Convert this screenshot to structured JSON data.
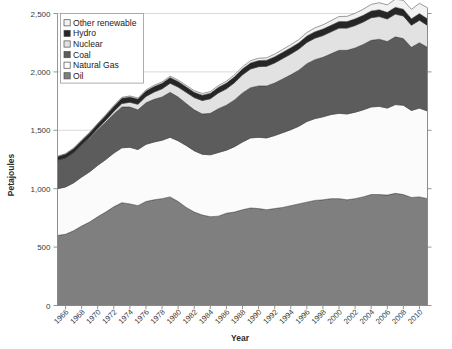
{
  "chart_data": {
    "type": "area",
    "title": "",
    "subtitle": "",
    "xlabel": "Year",
    "ylabel": "Petajoules",
    "stacked": true,
    "grid": true,
    "legend_position": "top-left",
    "xlim": [
      1965,
      2011
    ],
    "ylim": [
      0,
      2500
    ],
    "ytick_labels": [
      "0",
      "500",
      "1,000",
      "1,500",
      "2,000",
      "2,500"
    ],
    "ytick_values": [
      0,
      500,
      1000,
      1500,
      2000,
      2500
    ],
    "x": [
      1965,
      1966,
      1967,
      1968,
      1969,
      1970,
      1971,
      1972,
      1973,
      1974,
      1975,
      1976,
      1977,
      1978,
      1979,
      1980,
      1981,
      1982,
      1983,
      1984,
      1985,
      1986,
      1987,
      1988,
      1989,
      1990,
      1991,
      1992,
      1993,
      1994,
      1995,
      1996,
      1997,
      1998,
      1999,
      2000,
      2001,
      2002,
      2003,
      2004,
      2005,
      2006,
      2007,
      2008,
      2009,
      2010,
      2011
    ],
    "xtick_labels": [
      "1966",
      "1968",
      "1970",
      "1972",
      "1974",
      "1976",
      "1978",
      "1980",
      "1982",
      "1984",
      "1986",
      "1988",
      "1990",
      "1992",
      "1994",
      "1996",
      "1998",
      "2000",
      "2002",
      "2004",
      "2006",
      "2008",
      "2010"
    ],
    "xtick_values": [
      1966,
      1968,
      1970,
      1972,
      1974,
      1976,
      1978,
      1980,
      1982,
      1984,
      1986,
      1988,
      1990,
      1992,
      1994,
      1996,
      1998,
      2000,
      2002,
      2004,
      2006,
      2008,
      2010
    ],
    "series": [
      {
        "name": "Oil",
        "color": "#7f7f7f",
        "values": [
          600,
          610,
          640,
          680,
          715,
          760,
          800,
          845,
          880,
          870,
          855,
          890,
          905,
          915,
          930,
          890,
          840,
          800,
          775,
          760,
          765,
          790,
          800,
          820,
          835,
          830,
          820,
          830,
          840,
          855,
          870,
          885,
          900,
          905,
          915,
          915,
          905,
          915,
          930,
          950,
          950,
          945,
          960,
          950,
          925,
          930,
          915
        ]
      },
      {
        "name": "Natural Gas",
        "color": "#fbfbfb",
        "values": [
          400,
          405,
          410,
          420,
          430,
          440,
          450,
          460,
          470,
          485,
          480,
          490,
          495,
          500,
          510,
          520,
          530,
          525,
          520,
          530,
          545,
          540,
          560,
          580,
          600,
          610,
          615,
          625,
          640,
          650,
          665,
          690,
          700,
          710,
          720,
          730,
          735,
          740,
          745,
          750,
          755,
          745,
          760,
          765,
          745,
          760,
          750
        ]
      },
      {
        "name": "Coal",
        "color": "#5c5c5c",
        "values": [
          245,
          250,
          260,
          275,
          290,
          305,
          320,
          335,
          350,
          345,
          340,
          355,
          365,
          370,
          385,
          375,
          360,
          350,
          345,
          355,
          375,
          385,
          400,
          420,
          430,
          440,
          445,
          450,
          460,
          470,
          480,
          495,
          505,
          510,
          520,
          540,
          545,
          550,
          560,
          570,
          575,
          570,
          580,
          570,
          540,
          560,
          545
        ]
      },
      {
        "name": "Nuclear",
        "color": "#e2e2e2",
        "values": [
          0,
          0,
          0,
          2,
          5,
          10,
          16,
          22,
          30,
          40,
          48,
          55,
          62,
          70,
          78,
          85,
          95,
          105,
          115,
          125,
          135,
          140,
          148,
          155,
          160,
          165,
          168,
          172,
          175,
          178,
          180,
          182,
          184,
          186,
          188,
          190,
          190,
          192,
          192,
          194,
          194,
          193,
          195,
          194,
          190,
          192,
          188
        ]
      },
      {
        "name": "Hydro",
        "color": "#262626",
        "values": [
          28,
          30,
          32,
          34,
          36,
          38,
          40,
          42,
          44,
          45,
          44,
          46,
          47,
          48,
          49,
          48,
          47,
          46,
          46,
          47,
          48,
          49,
          50,
          51,
          52,
          52,
          52,
          53,
          53,
          54,
          54,
          55,
          55,
          56,
          56,
          57,
          56,
          57,
          57,
          58,
          58,
          57,
          58,
          58,
          56,
          57,
          56
        ]
      },
      {
        "name": "Other renewable",
        "color": "#f2f2f2",
        "values": [
          5,
          5,
          6,
          6,
          7,
          7,
          8,
          8,
          9,
          9,
          10,
          10,
          11,
          11,
          12,
          12,
          13,
          13,
          14,
          14,
          15,
          16,
          17,
          18,
          19,
          20,
          21,
          22,
          24,
          26,
          28,
          30,
          33,
          36,
          39,
          42,
          45,
          48,
          52,
          56,
          60,
          64,
          70,
          76,
          80,
          88,
          95
        ]
      }
    ],
    "stack_order_bottom_to_top": [
      "Oil",
      "Natural Gas",
      "Coal",
      "Nuclear",
      "Hydro",
      "Other renewable"
    ]
  },
  "legend": {
    "items": [
      {
        "label": "Other renewable",
        "color": "#f2f2f2"
      },
      {
        "label": "Hydro",
        "color": "#262626"
      },
      {
        "label": "Nuclear",
        "color": "#e2e2e2"
      },
      {
        "label": "Coal",
        "color": "#5c5c5c"
      },
      {
        "label": "Natural Gas",
        "color": "#fbfbfb"
      },
      {
        "label": "Oil",
        "color": "#7f7f7f"
      }
    ]
  },
  "axes": {
    "y_title": "Petajoules",
    "x_title": "Year"
  }
}
